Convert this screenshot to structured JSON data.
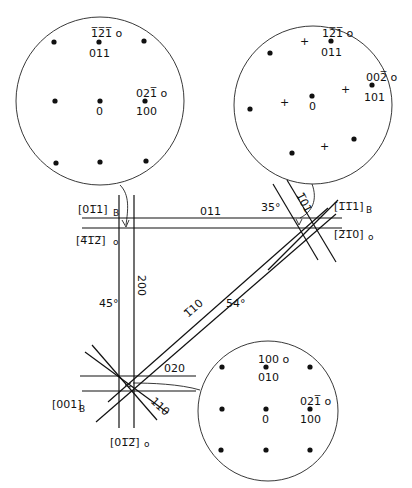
{
  "figure": {
    "type": "crystallographic orientation relationship diagram",
    "patterns": [
      {
        "id": "top-left",
        "center_label": "0",
        "spots": [
          {
            "upper": "1̅2̅1̅ o",
            "lower": "011"
          },
          {
            "upper": "021̅ o",
            "lower": "100"
          }
        ]
      },
      {
        "id": "top-right",
        "center_label": "0",
        "spots": [
          {
            "upper": "12̅1̅ o",
            "lower": "011"
          },
          {
            "upper": "002̅ o",
            "lower": "101"
          }
        ]
      },
      {
        "id": "bottom-right",
        "center_label": "0",
        "spots": [
          {
            "upper": "100 o",
            "lower": "010"
          },
          {
            "upper": "021̅ o",
            "lower": "100"
          }
        ]
      }
    ],
    "zone_axes": {
      "top_left_B": "[01̅1]",
      "top_left_B_sub": "B",
      "top_left_o": "[4̅1̅2̅]",
      "top_left_o_sub": "o",
      "top_right_B": "[1̅1̅1]",
      "top_right_B_sub": "B",
      "top_right_o": "[2̅1̅0]",
      "top_right_o_sub": "o",
      "bottom_left_B": "[001]",
      "bottom_left_B_sub": "B",
      "bottom_o": "[01̅2̅]",
      "bottom_o_sub": "o"
    },
    "kikuchi_bands": {
      "top_horizontal": "011",
      "top_right_diag": "1̅01",
      "vertical": "200",
      "long_diagonal": "1̅10",
      "bottom_horizontal": "020",
      "bottom_diag": "110"
    },
    "angles": {
      "top_right": "35°",
      "left": "45°",
      "diagonal": "54°"
    }
  }
}
